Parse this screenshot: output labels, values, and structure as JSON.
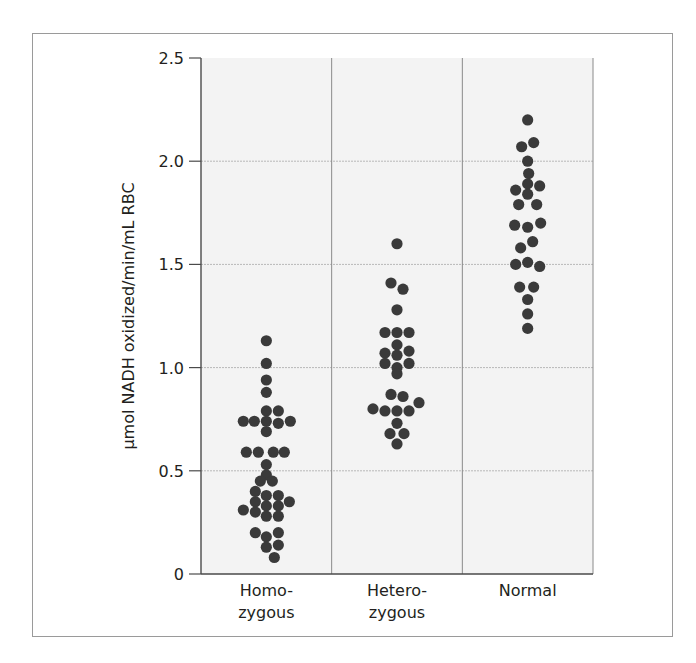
{
  "chart_data": {
    "type": "scatter",
    "subtype": "dot-plot (beeswarm)",
    "title": "",
    "xlabel": "",
    "ylabel": "µmol NADH oxidized/min/mL RBC",
    "ylim": [
      0,
      2.5
    ],
    "yticks": [
      0,
      0.5,
      1.0,
      1.5,
      2.0,
      2.5
    ],
    "ytick_labels": [
      "0",
      "0.5",
      "1.0",
      "1.5",
      "2.0",
      "2.5"
    ],
    "grid": {
      "horizontal": true,
      "style": "dotted",
      "vertical_dividers": true
    },
    "legend": null,
    "categories": [
      "Homo-\nzygous",
      "Hetero-\nzygous",
      "Normal"
    ],
    "category_lines": [
      [
        "Homo-",
        "zygous"
      ],
      [
        "Hetero-",
        "zygous"
      ],
      [
        "Normal"
      ]
    ],
    "colors": {
      "dot": "#3a3a3a",
      "plot_bg": "#f3f3f3",
      "grid": "#b8b8b8",
      "axis": "#4a4a4a",
      "frame": "#9a9a9a"
    },
    "series": [
      {
        "name": "Homozygous",
        "n": 37,
        "points": [
          {
            "y": 1.13,
            "dx": 0
          },
          {
            "y": 1.02,
            "dx": 0
          },
          {
            "y": 0.94,
            "dx": 0
          },
          {
            "y": 0.88,
            "dx": 0
          },
          {
            "y": 0.79,
            "dx": 0
          },
          {
            "y": 0.79,
            "dx": 12
          },
          {
            "y": 0.74,
            "dx": -23
          },
          {
            "y": 0.74,
            "dx": -12
          },
          {
            "y": 0.74,
            "dx": 0
          },
          {
            "y": 0.73,
            "dx": 12
          },
          {
            "y": 0.74,
            "dx": 24
          },
          {
            "y": 0.69,
            "dx": 0
          },
          {
            "y": 0.59,
            "dx": -20
          },
          {
            "y": 0.59,
            "dx": -8
          },
          {
            "y": 0.59,
            "dx": 7
          },
          {
            "y": 0.59,
            "dx": 18
          },
          {
            "y": 0.53,
            "dx": 0
          },
          {
            "y": 0.48,
            "dx": 0
          },
          {
            "y": 0.45,
            "dx": -6
          },
          {
            "y": 0.45,
            "dx": 6
          },
          {
            "y": 0.4,
            "dx": -11
          },
          {
            "y": 0.38,
            "dx": 0
          },
          {
            "y": 0.38,
            "dx": 12
          },
          {
            "y": 0.35,
            "dx": -11
          },
          {
            "y": 0.33,
            "dx": 0
          },
          {
            "y": 0.33,
            "dx": 12
          },
          {
            "y": 0.35,
            "dx": 23
          },
          {
            "y": 0.31,
            "dx": -23
          },
          {
            "y": 0.3,
            "dx": -11
          },
          {
            "y": 0.28,
            "dx": 0
          },
          {
            "y": 0.28,
            "dx": 12
          },
          {
            "y": 0.2,
            "dx": -11
          },
          {
            "y": 0.18,
            "dx": 0
          },
          {
            "y": 0.2,
            "dx": 12
          },
          {
            "y": 0.13,
            "dx": 0
          },
          {
            "y": 0.14,
            "dx": 12
          },
          {
            "y": 0.08,
            "dx": 8
          }
        ]
      },
      {
        "name": "Heterozygous",
        "n": 26,
        "points": [
          {
            "y": 1.6,
            "dx": 0
          },
          {
            "y": 1.41,
            "dx": -6
          },
          {
            "y": 1.38,
            "dx": 6
          },
          {
            "y": 1.28,
            "dx": 0
          },
          {
            "y": 1.17,
            "dx": -12
          },
          {
            "y": 1.17,
            "dx": 0
          },
          {
            "y": 1.17,
            "dx": 12
          },
          {
            "y": 1.11,
            "dx": 0
          },
          {
            "y": 1.07,
            "dx": -12
          },
          {
            "y": 1.06,
            "dx": 0
          },
          {
            "y": 1.08,
            "dx": 12
          },
          {
            "y": 1.02,
            "dx": -12
          },
          {
            "y": 1.02,
            "dx": 12
          },
          {
            "y": 1.0,
            "dx": 0
          },
          {
            "y": 0.97,
            "dx": 0
          },
          {
            "y": 0.87,
            "dx": -6
          },
          {
            "y": 0.86,
            "dx": 6
          },
          {
            "y": 0.83,
            "dx": 22
          },
          {
            "y": 0.8,
            "dx": -24
          },
          {
            "y": 0.79,
            "dx": -12
          },
          {
            "y": 0.79,
            "dx": 0
          },
          {
            "y": 0.79,
            "dx": 12
          },
          {
            "y": 0.73,
            "dx": 0
          },
          {
            "y": 0.68,
            "dx": -7
          },
          {
            "y": 0.68,
            "dx": 7
          },
          {
            "y": 0.63,
            "dx": 0
          }
        ]
      },
      {
        "name": "Normal",
        "n": 24,
        "points": [
          {
            "y": 2.2,
            "dx": 0
          },
          {
            "y": 2.07,
            "dx": -6
          },
          {
            "y": 2.09,
            "dx": 6
          },
          {
            "y": 2.0,
            "dx": 0
          },
          {
            "y": 1.94,
            "dx": 1
          },
          {
            "y": 1.89,
            "dx": 0
          },
          {
            "y": 1.88,
            "dx": 12
          },
          {
            "y": 1.86,
            "dx": -12
          },
          {
            "y": 1.84,
            "dx": 0
          },
          {
            "y": 1.79,
            "dx": -9
          },
          {
            "y": 1.79,
            "dx": 9
          },
          {
            "y": 1.69,
            "dx": -13
          },
          {
            "y": 1.68,
            "dx": 0
          },
          {
            "y": 1.7,
            "dx": 13
          },
          {
            "y": 1.58,
            "dx": -7
          },
          {
            "y": 1.61,
            "dx": 5
          },
          {
            "y": 1.5,
            "dx": -12
          },
          {
            "y": 1.51,
            "dx": 0
          },
          {
            "y": 1.49,
            "dx": 12
          },
          {
            "y": 1.39,
            "dx": -8
          },
          {
            "y": 1.39,
            "dx": 6
          },
          {
            "y": 1.33,
            "dx": 0
          },
          {
            "y": 1.26,
            "dx": 0
          },
          {
            "y": 1.19,
            "dx": 0
          }
        ]
      }
    ]
  }
}
